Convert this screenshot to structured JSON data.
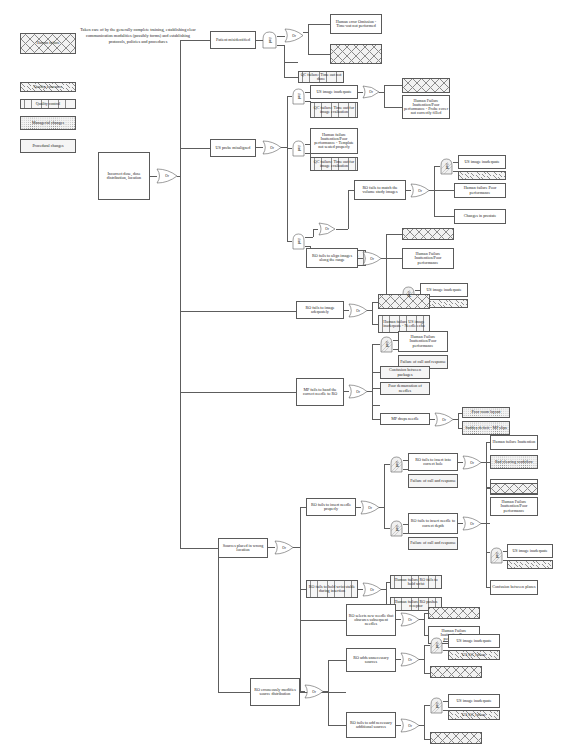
{
  "diagram": {
    "note": "Taken care of by the generally complete training, establishing clear communication modalities (possibly forms) and establishing protocols, policies and procedures"
  },
  "legend": {
    "items": [
      {
        "label": "Human failure",
        "pattern": "cross-hatch"
      },
      {
        "label": "Quality assurance",
        "pattern": "diagonal-hatch"
      },
      {
        "label": "Quality control",
        "pattern": "vertical-lines"
      },
      {
        "label": "Managerial changes",
        "pattern": "dotted"
      },
      {
        "label": "Procedural changes",
        "pattern": "grid"
      }
    ]
  },
  "gates": {
    "or": "Or",
    "and": "And"
  },
  "nodes": {
    "root": "Incorrect dose, dose distribution, location",
    "patient_misidentified": "Patient misidentified",
    "human_error_timeout": "Human error Omission - Time-out not performed",
    "qa_timeout": "Quality assurance",
    "qc_timeout_not_done": "QC failure: Time out not done",
    "us_probe_misaligned": "US probe misaligned",
    "us_image_inadequate_1": "US image inadequate",
    "qc_timeout_image_eval": "QC failure: Time out for image evaluation",
    "qa_probe": "Quality assurance",
    "hf_probe_cover": "Human Failure Inattention/Poor performance - Probe cover not correctly filled",
    "hf_template_seated": "Human failure Inattention/Poor performance - Template not seated properly",
    "qc_prostate_image_timeout": "QC failure: Prostate image time out",
    "ro_fails_match_volume": "RO fails to match the volume study images",
    "us_image_inadequate_2": "US image inadequate",
    "qa_volume": "Quality assurance",
    "hf_poor_performance_volume": "Human failure Poor performance",
    "changes_in_prostate": "Changes in prostate",
    "ro_fails_align_range": "RO fails to align images along the range",
    "qa_range": "Quality assurance",
    "hf_align_range": "Human Failure Inattention/Poor performance",
    "us_image_inadequate_3": "US image inadequate",
    "qa_range_2": "Quality assurance",
    "ro_fails_image_adequately": "RO fails to image adequately",
    "qa_image_adequately": "Quality assurance",
    "hf_needle_echo": "Human failure US image inadequate - Needle echo",
    "mp_fails_hand_needle": "MP fails to hand the correct needle to RO",
    "hf_inattention_hand": "Human Failure Inattention/Poor performance",
    "failure_call_response_1": "Failure of call and response",
    "confusion_packages": "Confusion between packages",
    "poor_demarcation_needles": "Poor demarcation of needles",
    "mp_drops_needle": "MP drops needle",
    "poor_room_layout": "Poor room layout",
    "sudden_deficit_mp": "Sudden deficit - MP slips",
    "sources_placed_wrong": "Sources placed in wrong location",
    "ro_fails_insert_needle": "RO fails to insert needle properly",
    "ro_fails_correct_hole": "RO fails to insert into correct hole",
    "failure_call_response_2": "Failure of call and response",
    "hf_inattention_hole": "Human failure Inattention",
    "bad_clearing_workflow": "Bad clearing workflow",
    "confusion_between_holes": "Confusion between holes",
    "ro_fails_correct_depth": "RO fails to insert needle to correct depth",
    "failure_call_response_3": "Failure of call and response",
    "qa_depth": "Quality assurance",
    "hf_inattention_depth": "Human Failure Inattention/Poor performance",
    "us_image_inadequate_4": "US image inadequate",
    "qa_depth_2": "Quality assurance",
    "confusion_between_planes": "Confusion between planes",
    "ro_fails_hold_wrist": "RO fails to hold wrist stable during insertion",
    "hf_hold_wrist": "Human failure RO fails to hold wrist",
    "hf_pushes_receptor": "Human failure RO pushes receptor",
    "ro_selects_new_needle": "RO selects new needle that obscures subsequent needles",
    "qa_new_needle": "Quality assurance",
    "hf_new_needle": "Human Failure Inattention/Poor performance",
    "ro_erroneously_modifies": "RO erroneously modifies source distribution",
    "ro_adds_unnecessary": "RO adds unnecessary sources",
    "us_image_inadequate_5": "US image inadequate",
    "qa_unnecessary": "Quality assurance",
    "qc_unnecessary": "US QC failure",
    "proc_unnecessary": "Procedural changes",
    "ro_fails_add_necessary": "RO fails to add necessary additional sources",
    "us_image_inadequate_6": "US image inadequate",
    "qa_necessary": "Quality assurance",
    "qc_necessary": "US QC failure",
    "proc_necessary": "Procedural changes"
  }
}
